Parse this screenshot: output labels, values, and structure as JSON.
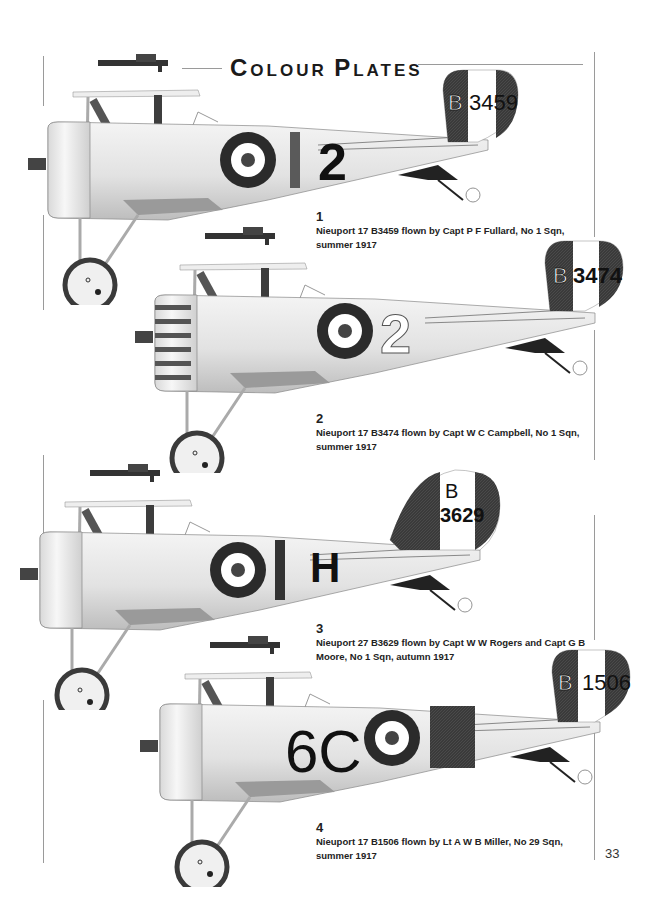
{
  "page": {
    "title": "Colour Plates",
    "title_parts": [
      {
        "cap": "C",
        "rest": "OLOUR"
      },
      {
        "cap": "P",
        "rest": "LATES"
      }
    ],
    "page_number": "33"
  },
  "plates": [
    {
      "number": "1",
      "caption_line1": "Nieuport 17 B3459 flown by Capt P F Fullard, No 1 Sqn,",
      "caption_line2": "summer 1917",
      "serial_prefix": "B",
      "serial_number": "3459",
      "fuselage_marking": "2",
      "variant": "fullard"
    },
    {
      "number": "2",
      "caption_line1": "Nieuport 17 B3474 flown by Capt W C Campbell, No 1 Sqn,",
      "caption_line2": "summer 1917",
      "serial_prefix": "B",
      "serial_number": "3474",
      "fuselage_marking": "2",
      "variant": "campbell"
    },
    {
      "number": "3",
      "caption_line1": "Nieuport 27 B3629 flown by Capt W W Rogers and Capt G B",
      "caption_line2": "Moore, No 1 Sqn, autumn 1917",
      "serial_prefix": "B",
      "serial_number": "3629",
      "fuselage_marking": "H",
      "variant": "rogers"
    },
    {
      "number": "4",
      "caption_line1": "Nieuport 17 B1506 flown by Lt A W B Miller, No 29 Sqn,",
      "caption_line2": "summer 1917",
      "serial_prefix": "B",
      "serial_number": "1506",
      "fuselage_marking": "6C",
      "variant": "miller"
    }
  ],
  "colors": {
    "roundel_outer": "#2b2b2b",
    "roundel_mid": "#ffffff",
    "roundel_center": "#3a3a3a",
    "fuselage": "#e6e6e6",
    "dark_band": "#3c3c3c",
    "frame_line": "#9a9a9a"
  }
}
